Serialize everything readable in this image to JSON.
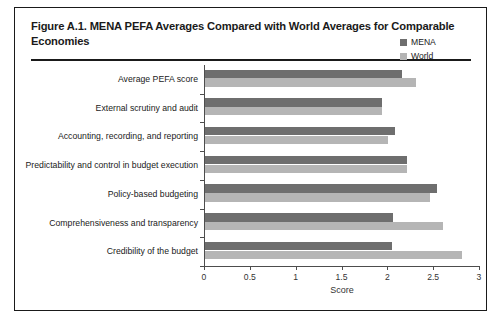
{
  "figure": {
    "title": "Figure A.1. MENA PEFA Averages Compared with World Averages for Comparable Economies"
  },
  "colors": {
    "mena": "#6e6e6e",
    "world": "#b5b5b5",
    "frame": "#1a1a1a",
    "axis": "#4d4d4d"
  },
  "legend": {
    "position": "top-right",
    "entries": [
      {
        "label": "MENA",
        "color": "#6e6e6e"
      },
      {
        "label": "World",
        "color": "#b5b5b5"
      }
    ]
  },
  "axis": {
    "x_title": "Score",
    "x_ticks": [
      "0",
      "0.5",
      "1",
      "1.5",
      "2",
      "2.5",
      "3"
    ]
  },
  "chart_data": {
    "type": "bar",
    "orientation": "horizontal",
    "title": "Figure A.1. MENA PEFA Averages Compared with World Averages for Comparable Economies",
    "xlabel": "Score",
    "ylabel": "",
    "xlim": [
      0,
      3
    ],
    "xticks": [
      0,
      0.5,
      1,
      1.5,
      2,
      2.5,
      3
    ],
    "grid": false,
    "legend_position": "top-right",
    "categories": [
      "Average PEFA score",
      "External scrutiny and audit",
      "Accounting, recording, and reporting",
      "Predictability and control in budget execution",
      "Policy-based budgeting",
      "Comprehensiveness and transparency",
      "Credibility of the budget"
    ],
    "series": [
      {
        "name": "MENA",
        "color": "#6e6e6e",
        "values": [
          2.15,
          1.93,
          2.07,
          2.2,
          2.53,
          2.05,
          2.04
        ]
      },
      {
        "name": "World",
        "color": "#b5b5b5",
        "values": [
          2.3,
          1.93,
          2.0,
          2.2,
          2.45,
          2.6,
          2.8
        ]
      }
    ]
  }
}
